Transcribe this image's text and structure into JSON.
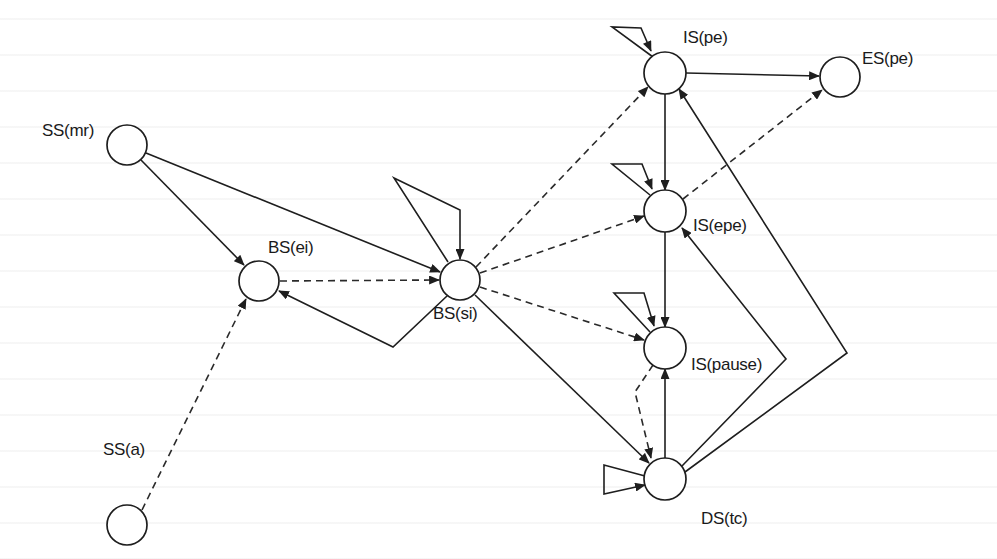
{
  "diagram": {
    "type": "state-transition-graph",
    "nodes": [
      {
        "id": "ss_mr",
        "label": "SS(mr)",
        "cx": 127,
        "cy": 145,
        "r": 20,
        "label_x": 42,
        "label_y": 121
      },
      {
        "id": "bs_ei",
        "label": "BS(ei)",
        "cx": 259,
        "cy": 281,
        "r": 20,
        "label_x": 268,
        "label_y": 238
      },
      {
        "id": "bs_si",
        "label": "BS(si)",
        "cx": 460,
        "cy": 280,
        "r": 20,
        "label_x": 433,
        "label_y": 304
      },
      {
        "id": "ss_a",
        "label": "SS(a)",
        "cx": 127,
        "cy": 525,
        "r": 20,
        "label_x": 103,
        "label_y": 440
      },
      {
        "id": "is_pe",
        "label": "IS(pe)",
        "cx": 665,
        "cy": 73,
        "r": 21,
        "label_x": 683,
        "label_y": 28
      },
      {
        "id": "es_pe",
        "label": "ES(pe)",
        "cx": 840,
        "cy": 77,
        "r": 20,
        "label_x": 862,
        "label_y": 49
      },
      {
        "id": "is_epe",
        "label": "IS(epe)",
        "cx": 665,
        "cy": 211,
        "r": 21,
        "label_x": 693,
        "label_y": 216
      },
      {
        "id": "is_pause",
        "label": "IS(pause)",
        "cx": 665,
        "cy": 348,
        "r": 21,
        "label_x": 691,
        "label_y": 355
      },
      {
        "id": "ds_tc",
        "label": "DS(tc)",
        "cx": 665,
        "cy": 479,
        "r": 21,
        "label_x": 701,
        "label_y": 509
      }
    ],
    "edges": [
      {
        "from": "SS(mr)",
        "to": "BS(ei)",
        "style": "solid",
        "points": [
          [
            141,
            160
          ],
          [
            244,
            265
          ]
        ]
      },
      {
        "from": "SS(mr)",
        "to": "BS(si)",
        "style": "solid",
        "points": [
          [
            146,
            153
          ],
          [
            440,
            272
          ]
        ]
      },
      {
        "from": "SS(a)",
        "to": "BS(ei)",
        "style": "dashed",
        "points": [
          [
            142,
            510
          ],
          [
            246,
            299
          ]
        ]
      },
      {
        "from": "BS(ei)",
        "to": "BS(si)",
        "style": "dashed",
        "points": [
          [
            280,
            281
          ],
          [
            439,
            280
          ]
        ]
      },
      {
        "from": "BS(si)",
        "to": "BS(ei)",
        "style": "solid",
        "points": [
          [
            447,
            296
          ],
          [
            393,
            347
          ],
          [
            279,
            291
          ]
        ]
      },
      {
        "from": "BS(si)",
        "to": "BS(si)",
        "style": "solid",
        "label": "self-loop",
        "points": [
          [
            448,
            262
          ],
          [
            394,
            178
          ],
          [
            460,
            210
          ],
          [
            460,
            259
          ]
        ]
      },
      {
        "from": "BS(si)",
        "to": "IS(pe)",
        "style": "dashed",
        "points": [
          [
            476,
            267
          ],
          [
            648,
            87
          ]
        ]
      },
      {
        "from": "BS(si)",
        "to": "IS(epe)",
        "style": "dashed",
        "points": [
          [
            480,
            273
          ],
          [
            644,
            216
          ]
        ]
      },
      {
        "from": "BS(si)",
        "to": "IS(pause)",
        "style": "dashed",
        "points": [
          [
            480,
            287
          ],
          [
            644,
            340
          ]
        ]
      },
      {
        "from": "BS(si)",
        "to": "DS(tc)",
        "style": "solid",
        "points": [
          [
            475,
            295
          ],
          [
            649,
            463
          ]
        ]
      },
      {
        "from": "IS(pe)",
        "to": "IS(pe)",
        "style": "solid",
        "label": "self-loop",
        "points": [
          [
            653,
            57
          ],
          [
            612,
            27
          ],
          [
            641,
            28
          ],
          [
            651,
            51
          ]
        ]
      },
      {
        "from": "IS(pe)",
        "to": "ES(pe)",
        "style": "solid",
        "points": [
          [
            686,
            73
          ],
          [
            819,
            76
          ]
        ]
      },
      {
        "from": "IS(pe)",
        "to": "IS(epe)",
        "style": "solid",
        "points": [
          [
            665,
            94
          ],
          [
            665,
            190
          ]
        ]
      },
      {
        "from": "IS(epe)",
        "to": "ES(pe)",
        "style": "dashed",
        "points": [
          [
            683,
            199
          ],
          [
            822,
            90
          ]
        ]
      },
      {
        "from": "IS(epe)",
        "to": "IS(epe)",
        "style": "solid",
        "label": "self-loop",
        "points": [
          [
            650,
            195
          ],
          [
            612,
            164
          ],
          [
            642,
            164
          ],
          [
            652,
            189
          ]
        ]
      },
      {
        "from": "IS(epe)",
        "to": "IS(pause)",
        "style": "solid",
        "points": [
          [
            665,
            232
          ],
          [
            665,
            327
          ]
        ]
      },
      {
        "from": "IS(pause)",
        "to": "IS(pause)",
        "style": "solid",
        "label": "self-loop",
        "points": [
          [
            650,
            332
          ],
          [
            614,
            293
          ],
          [
            644,
            293
          ],
          [
            654,
            326
          ]
        ]
      },
      {
        "from": "IS(pause)",
        "to": "DS(tc)",
        "style": "dashed",
        "points": [
          [
            653,
            365
          ],
          [
            635,
            392
          ],
          [
            651,
            458
          ]
        ]
      },
      {
        "from": "DS(tc)",
        "to": "IS(pause)",
        "style": "solid",
        "points": [
          [
            665,
            458
          ],
          [
            665,
            369
          ]
        ]
      },
      {
        "from": "DS(tc)",
        "to": "IS(epe)",
        "style": "solid",
        "points": [
          [
            682,
            466
          ],
          [
            786,
            359
          ],
          [
            682,
            228
          ]
        ]
      },
      {
        "from": "DS(tc)",
        "to": "IS(pe)",
        "style": "solid",
        "points": [
          [
            685,
            472
          ],
          [
            847,
            353
          ],
          [
            679,
            89
          ]
        ]
      },
      {
        "from": "DS(tc)",
        "to": "DS(tc)",
        "style": "solid",
        "label": "self-loop",
        "points": [
          [
            645,
            476
          ],
          [
            604,
            465
          ],
          [
            604,
            494
          ],
          [
            645,
            485
          ]
        ]
      }
    ],
    "legend": {
      "solid": "transition",
      "dashed": "alternate transition"
    }
  }
}
